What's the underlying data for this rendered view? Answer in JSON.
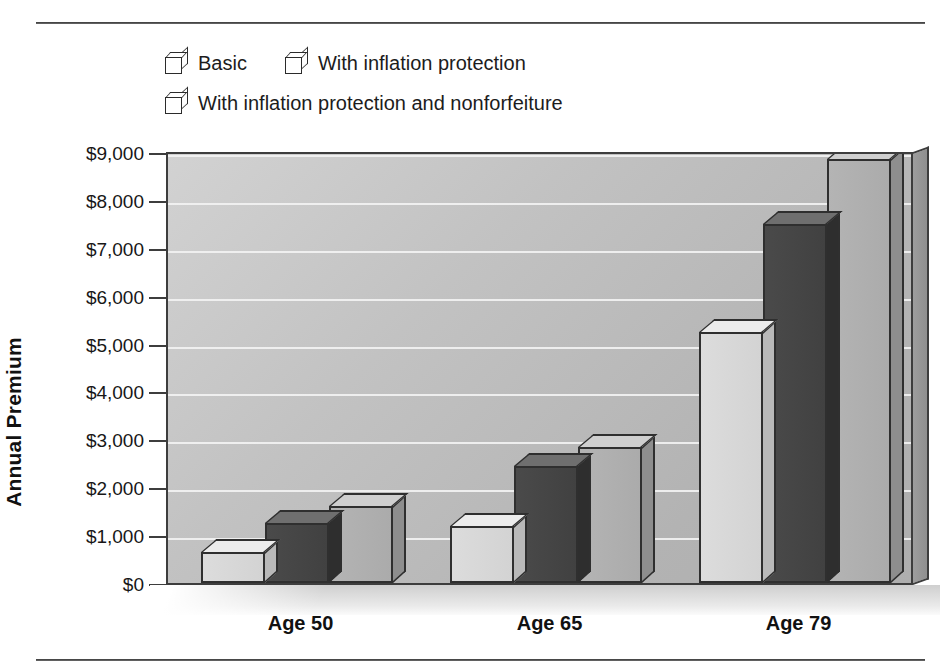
{
  "chart_data": {
    "type": "bar",
    "title": "",
    "xlabel": "",
    "ylabel": "Annual Premium",
    "categories": [
      "Age 50",
      "Age 65",
      "Age 79"
    ],
    "ylim": [
      0,
      9000
    ],
    "ytick_step": 1000,
    "ytick_labels": [
      "$9,000",
      "$8,000",
      "$7,000",
      "$6,000",
      "$5,000",
      "$4,000",
      "$3,000",
      "$2,000",
      "$1,000",
      "$0"
    ],
    "ytick_values": [
      9000,
      8000,
      7000,
      6000,
      5000,
      4000,
      3000,
      2000,
      1000,
      0
    ],
    "grid": true,
    "legend_position": "top-left",
    "style": "3d-bar",
    "series": [
      {
        "name": "Basic",
        "color": "#d8d8d8",
        "values": [
          650,
          1200,
          5250
        ]
      },
      {
        "name": "With inflation protection",
        "color": "#444444",
        "values": [
          1250,
          2450,
          7500
        ]
      },
      {
        "name": "With inflation protection and nonforfeiture",
        "color": "#b0b0b0",
        "values": [
          1600,
          2850,
          8850
        ]
      }
    ]
  },
  "legend": {
    "rows": [
      {
        "items": [
          {
            "label": "Basic",
            "swatch": "light-gray-cube-swatch"
          },
          {
            "label": "With inflation protection",
            "swatch": "dark-gray-cube-swatch"
          }
        ]
      },
      {
        "items": [
          {
            "label": "With inflation protection and nonforfeiture",
            "swatch": "medium-gray-cube-swatch"
          }
        ]
      }
    ]
  }
}
